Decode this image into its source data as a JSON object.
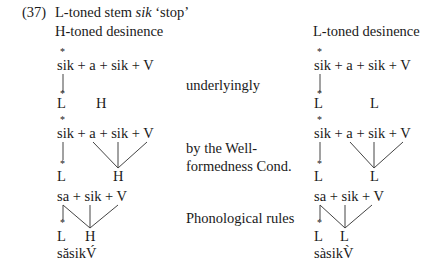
{
  "example": {
    "number": "(37)",
    "heading_prefix": "L-toned stem ",
    "heading_word": "sik",
    "heading_gloss": " ‘stop’",
    "left_column_title": "H-toned desinence",
    "right_column_title": "L-toned desinence"
  },
  "stages": [
    {
      "label_lines": [
        "underlyingly"
      ]
    },
    {
      "label_lines": [
        "by the Well-",
        "formedness Cond."
      ]
    },
    {
      "label_lines": [
        "Phonological rules"
      ]
    }
  ],
  "left": {
    "row1": {
      "formula": "sik + a + sik + V",
      "accent_mark": "*",
      "tones": [
        "L",
        "H"
      ]
    },
    "row2": {
      "formula": "sik + a + sik + V",
      "accent_mark": "*",
      "tones": [
        "L",
        "H"
      ]
    },
    "row3": {
      "formula": "sa + sik + V",
      "accent_mark": "*",
      "tones": [
        "L",
        "H"
      ],
      "surface": "săsikV́"
    }
  },
  "right": {
    "row1": {
      "formula": "sik + a + sik + V",
      "accent_mark": "*",
      "tones": [
        "L",
        "L"
      ]
    },
    "row2": {
      "formula": "sik + a + sik + V",
      "accent_mark": "*",
      "tones": [
        "L",
        "L"
      ]
    },
    "row3": {
      "formula": "sa + sik + V",
      "accent_mark": "*",
      "tones": [
        "L",
        "L"
      ],
      "surface": "sàsikV̀"
    }
  }
}
